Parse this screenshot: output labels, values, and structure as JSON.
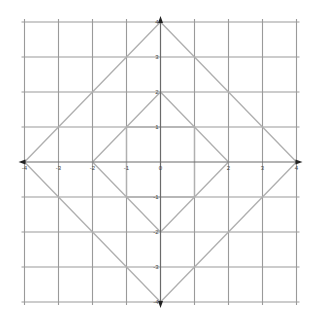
{
  "figure": {
    "type": "coordinate-grid",
    "colors": {
      "background": "#ffffff",
      "grid": "#9a9a9a",
      "axis": "#6a6a6a",
      "shapes": "#b0b0b0",
      "labels": "#444444"
    }
  },
  "axes": {
    "x": {
      "min": -4,
      "max": 4,
      "step": 1
    },
    "y": {
      "min": -4,
      "max": 4,
      "step": 1
    },
    "x_tick_labels": [
      "-4",
      "-3",
      "-2",
      "-1",
      "0",
      "2",
      "3",
      "4"
    ],
    "y_tick_labels": [
      "4",
      "3",
      "2",
      "1",
      "-1",
      "-2",
      "-3",
      "-4"
    ],
    "arrows": [
      "up",
      "down",
      "left",
      "right"
    ]
  },
  "shapes": [
    {
      "name": "outer-diamond",
      "vertices": [
        [
          0,
          4
        ],
        [
          4,
          0
        ],
        [
          0,
          -4
        ],
        [
          -4,
          0
        ]
      ]
    },
    {
      "name": "middle-diamond",
      "vertices": [
        [
          0,
          2
        ],
        [
          2,
          0
        ],
        [
          0,
          -2
        ],
        [
          -2,
          0
        ]
      ]
    },
    {
      "name": "inner-square",
      "vertices": [
        [
          -1,
          1
        ],
        [
          1,
          1
        ],
        [
          1,
          -1
        ],
        [
          -1,
          -1
        ]
      ]
    }
  ]
}
